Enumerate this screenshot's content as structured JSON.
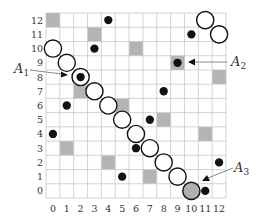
{
  "diagram": {
    "grid": {
      "cols": 13,
      "rows": 13
    },
    "x_ticks": [
      "0",
      "1",
      "2",
      "3",
      "4",
      "5",
      "6",
      "7",
      "8",
      "9",
      "10",
      "11",
      "12"
    ],
    "y_ticks": [
      "0",
      "1",
      "2",
      "3",
      "4",
      "5",
      "6",
      "7",
      "8",
      "9",
      "10",
      "11",
      "12"
    ],
    "colors": {
      "grid_line": "#c8c8c8",
      "gray_cell": "#b4b4b4",
      "dot": "#111111",
      "circle_stroke": "#111111",
      "circle_fill": "#ffffff",
      "highlight_circle_fill": "#b0b0b0",
      "annotation": "#333333"
    },
    "gray_cells": [
      {
        "col": 0,
        "row": 12
      },
      {
        "col": 3,
        "row": 11
      },
      {
        "col": 6,
        "row": 10
      },
      {
        "col": 9,
        "row": 9
      },
      {
        "col": 12,
        "row": 8
      },
      {
        "col": 2,
        "row": 7
      },
      {
        "col": 5,
        "row": 6
      },
      {
        "col": 8,
        "row": 5
      },
      {
        "col": 11,
        "row": 4
      },
      {
        "col": 1,
        "row": 3
      },
      {
        "col": 4,
        "row": 2
      },
      {
        "col": 7,
        "row": 1
      }
    ],
    "dots": [
      {
        "col": 4,
        "row": 12
      },
      {
        "col": 10,
        "row": 11
      },
      {
        "col": 3,
        "row": 10
      },
      {
        "col": 9,
        "row": 9
      },
      {
        "col": 2,
        "row": 8
      },
      {
        "col": 8,
        "row": 7
      },
      {
        "col": 1,
        "row": 6
      },
      {
        "col": 7,
        "row": 5
      },
      {
        "col": 0,
        "row": 4
      },
      {
        "col": 6,
        "row": 3
      },
      {
        "col": 12,
        "row": 2
      },
      {
        "col": 5,
        "row": 1
      },
      {
        "col": 11,
        "row": 0
      }
    ],
    "circles": [
      {
        "col": 11,
        "row": 12,
        "filled": false
      },
      {
        "col": 12,
        "row": 11,
        "filled": false
      },
      {
        "col": 0,
        "row": 10,
        "filled": false
      },
      {
        "col": 1,
        "row": 9,
        "filled": false
      },
      {
        "col": 2,
        "row": 8,
        "filled": false
      },
      {
        "col": 3,
        "row": 7,
        "filled": false
      },
      {
        "col": 4,
        "row": 6,
        "filled": false
      },
      {
        "col": 5,
        "row": 5,
        "filled": false
      },
      {
        "col": 6,
        "row": 4,
        "filled": false
      },
      {
        "col": 7,
        "row": 3,
        "filled": false
      },
      {
        "col": 8,
        "row": 2,
        "filled": false
      },
      {
        "col": 9,
        "row": 1,
        "filled": false
      },
      {
        "col": 10,
        "row": 0,
        "filled": true
      }
    ],
    "annotations": [
      {
        "id": "A1",
        "letter": "A",
        "sub": "1",
        "target": {
          "col": 2,
          "row": 8
        },
        "side": "left"
      },
      {
        "id": "A2",
        "letter": "A",
        "sub": "2",
        "target": {
          "col": 9,
          "row": 9
        },
        "side": "right"
      },
      {
        "id": "A3",
        "letter": "A",
        "sub": "3",
        "target": {
          "col": 11,
          "row": 1
        },
        "side": "right-up"
      }
    ]
  }
}
